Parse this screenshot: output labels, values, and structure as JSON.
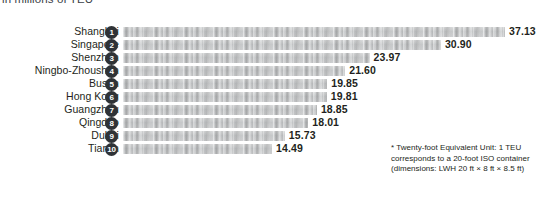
{
  "subtitle": "in millions of TEU",
  "footnote": {
    "line1": "* Twenty-foot Equivalent Unit: 1 TEU",
    "line2": "corresponds to a 20-foot ISO container",
    "line3": "(dimensions: LWH 20 ft × 8 ft × 8.5 ft)"
  },
  "chart_data": {
    "type": "bar",
    "orientation": "horizontal",
    "title": "",
    "subtitle": "in millions of TEU",
    "xlabel": "",
    "ylabel": "",
    "xlim": [
      0,
      37.13
    ],
    "grid": false,
    "legend": false,
    "value_format": "2 decimals",
    "categories": [
      "Shanghai",
      "Singapore",
      "Shenzhen",
      "Ningbo-Zhoushan",
      "Busan",
      "Hong Kong",
      "Guangzhou",
      "Qingdao",
      "Dubai",
      "Tianjin"
    ],
    "values": [
      37.13,
      30.9,
      23.97,
      21.6,
      19.85,
      19.81,
      18.85,
      18.01,
      15.73,
      14.49
    ],
    "ranks": [
      "1",
      "2",
      "3",
      "4",
      "5",
      "6",
      "7",
      "8",
      "9",
      "10"
    ],
    "labels": [
      "37.13",
      "30.90",
      "23.97",
      "21.60",
      "19.85",
      "19.81",
      "18.85",
      "18.01",
      "15.73",
      "14.49"
    ],
    "bar_color": "#bcbfc1",
    "rank_badge_color": "#2f3337",
    "text_color": "#231f20"
  }
}
